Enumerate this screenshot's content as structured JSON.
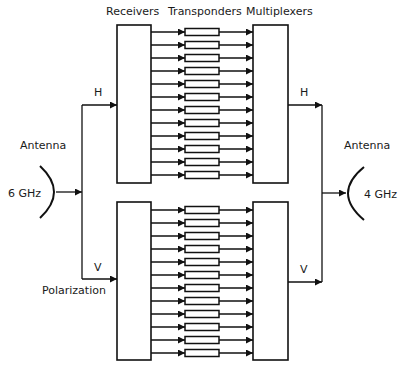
{
  "headers": {
    "receivers": "Receivers",
    "transponders": "Transponders",
    "multiplexers": "Multiplexers"
  },
  "left_antenna": {
    "label": "Antenna",
    "frequency": "6 GHz",
    "polarization_label": "Polarization"
  },
  "right_antenna": {
    "label": "Antenna",
    "frequency": "4 GHz"
  },
  "polarizations": {
    "horizontal": "H",
    "vertical": "V"
  },
  "groups": [
    {
      "name": "horizontal",
      "polarization": "H",
      "channel_count": 12
    },
    {
      "name": "vertical",
      "polarization": "V",
      "channel_count": 12
    }
  ],
  "colors": {
    "line": "#111111",
    "background": "#ffffff"
  }
}
